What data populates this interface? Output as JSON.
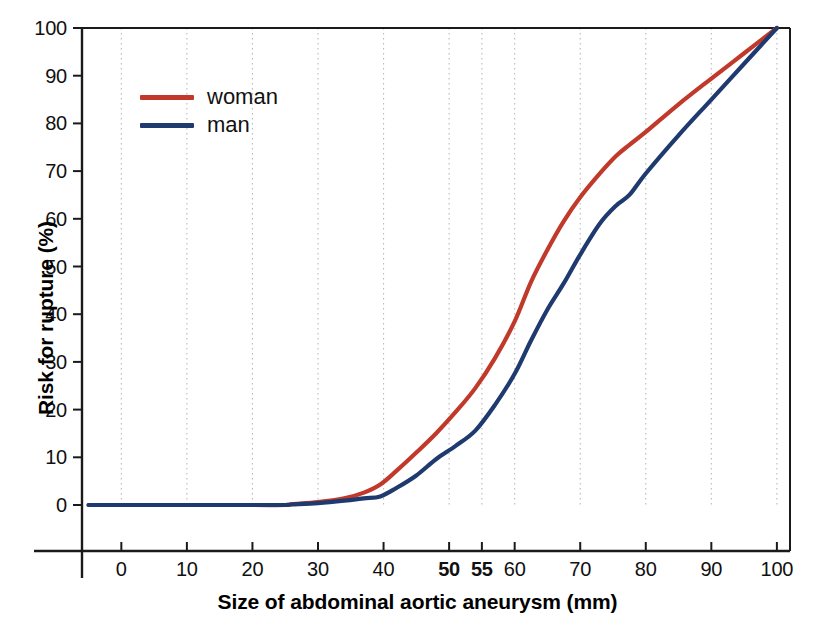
{
  "chart_data": {
    "type": "line",
    "title": "",
    "xlabel": "Size of abdominal aortic aneurysm (mm)",
    "ylabel": "Risk for rupture (%)",
    "xlim": [
      -6,
      102
    ],
    "ylim": [
      0,
      100
    ],
    "grid": true,
    "grid_axis": "x",
    "legend_position": "upper-left-inside",
    "x_ticks": [
      {
        "value": 0,
        "label": "0",
        "bold": false
      },
      {
        "value": 10,
        "label": "10",
        "bold": false
      },
      {
        "value": 20,
        "label": "20",
        "bold": false
      },
      {
        "value": 30,
        "label": "30",
        "bold": false
      },
      {
        "value": 40,
        "label": "40",
        "bold": false
      },
      {
        "value": 50,
        "label": "50",
        "bold": true
      },
      {
        "value": 55,
        "label": "55",
        "bold": true
      },
      {
        "value": 60,
        "label": "60",
        "bold": false
      },
      {
        "value": 70,
        "label": "70",
        "bold": false
      },
      {
        "value": 80,
        "label": "80",
        "bold": false
      },
      {
        "value": 90,
        "label": "90",
        "bold": false
      },
      {
        "value": 100,
        "label": "100",
        "bold": false
      }
    ],
    "y_ticks": [
      {
        "value": 0,
        "label": "0"
      },
      {
        "value": 10,
        "label": "10"
      },
      {
        "value": 20,
        "label": "20"
      },
      {
        "value": 30,
        "label": "30"
      },
      {
        "value": 40,
        "label": "40"
      },
      {
        "value": 50,
        "label": "50"
      },
      {
        "value": 60,
        "label": "60"
      },
      {
        "value": 70,
        "label": "70"
      },
      {
        "value": 80,
        "label": "80"
      },
      {
        "value": 90,
        "label": "90"
      },
      {
        "value": 100,
        "label": "100"
      }
    ],
    "series": [
      {
        "name": "woman",
        "color": "#C0392B",
        "points": [
          [
            -5,
            0
          ],
          [
            0,
            0
          ],
          [
            10,
            0
          ],
          [
            20,
            0
          ],
          [
            25,
            0
          ],
          [
            26,
            0.2
          ],
          [
            30,
            0.6
          ],
          [
            34,
            1.4
          ],
          [
            37,
            2.6
          ],
          [
            39.5,
            4.3
          ],
          [
            42,
            7.2
          ],
          [
            45,
            11.0
          ],
          [
            48,
            15.0
          ],
          [
            51,
            19.5
          ],
          [
            54,
            24.5
          ],
          [
            57,
            30.8
          ],
          [
            60,
            38.5
          ],
          [
            62.5,
            46.8
          ],
          [
            65,
            53.5
          ],
          [
            67.5,
            59.5
          ],
          [
            70,
            64.5
          ],
          [
            73,
            69.5
          ],
          [
            75.5,
            73.2
          ],
          [
            77.5,
            75.5
          ],
          [
            80,
            78.2
          ],
          [
            85,
            84.0
          ],
          [
            90,
            89.4
          ],
          [
            95,
            94.7
          ],
          [
            100,
            100
          ]
        ]
      },
      {
        "name": "man",
        "color": "#1F3A6E",
        "points": [
          [
            -5,
            0
          ],
          [
            0,
            0
          ],
          [
            10,
            0
          ],
          [
            20,
            0
          ],
          [
            25,
            0
          ],
          [
            26,
            0.1
          ],
          [
            30,
            0.4
          ],
          [
            34,
            0.9
          ],
          [
            37,
            1.4
          ],
          [
            39.5,
            1.8
          ],
          [
            42,
            3.6
          ],
          [
            45,
            6.2
          ],
          [
            48,
            9.6
          ],
          [
            51,
            12.4
          ],
          [
            54,
            15.6
          ],
          [
            57,
            21.0
          ],
          [
            60,
            27.5
          ],
          [
            62.5,
            34.5
          ],
          [
            65,
            41.0
          ],
          [
            67.5,
            46.5
          ],
          [
            70,
            52.5
          ],
          [
            73,
            59.0
          ],
          [
            75.5,
            62.8
          ],
          [
            77.5,
            65.0
          ],
          [
            80,
            69.5
          ],
          [
            85,
            77.5
          ],
          [
            90,
            85.0
          ],
          [
            95,
            92.5
          ],
          [
            100,
            100
          ]
        ]
      }
    ],
    "legend": [
      {
        "label": "woman",
        "color": "#C0392B"
      },
      {
        "label": "man",
        "color": "#1F3A6E"
      }
    ]
  },
  "geometry": {
    "plot_left": 82,
    "plot_right": 790,
    "plot_top": 28,
    "plot_bottom": 505,
    "x_data_min": -6,
    "x_data_max": 102,
    "axis_line_left": 82,
    "axis_baseline_y": 505,
    "xaxis_rule_y": 551,
    "xaxis_rule_left": 34,
    "xaxis_rule_right": 790,
    "yaxis_stub_bottom": 578
  },
  "style": {
    "axis_color": "#1a1a1a",
    "grid_color": "#b9b9b9",
    "background": "#ffffff",
    "line_width": 4.2
  }
}
